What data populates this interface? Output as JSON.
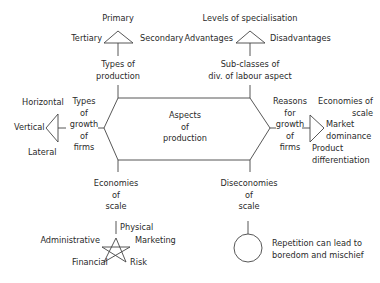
{
  "center": {
    "line1": "Aspects",
    "line2": "of",
    "line3": "production"
  },
  "types_of_production": {
    "label1": "Types of",
    "label2": "production",
    "items": {
      "top": "Primary",
      "left": "Tertiary",
      "right": "Secondary"
    }
  },
  "sub_classes": {
    "label1": "Sub-classes of",
    "label2": "div. of labour aspect",
    "items": {
      "top": "Levels of specialisation",
      "left": "Advantages",
      "right": "Disadvantages"
    }
  },
  "types_of_growth": {
    "l1": "Types",
    "l2": "of",
    "l3": "growth",
    "l4": "of",
    "l5": "firms",
    "items": {
      "top": "Horizontal",
      "mid": "Vertical",
      "bottom": "Lateral"
    }
  },
  "reasons_for_growth": {
    "l1": "Reasons",
    "l2": "for",
    "l3": "growth",
    "l4": "of",
    "l5": "firms",
    "items": {
      "a1": "Economies of",
      "a2": "scale",
      "b1": "Market",
      "b2": "dominance",
      "c1": "Product",
      "c2": "differentiation"
    }
  },
  "economies_of_scale": {
    "l1": "Economies",
    "l2": "of",
    "l3": "scale",
    "items": {
      "top": "Physical",
      "left": "Administrative",
      "right": "Marketing",
      "bl": "Financial",
      "br": "Risk"
    }
  },
  "diseconomies_of_scale": {
    "l1": "Diseconomies",
    "l2": "of",
    "l3": "scale",
    "items": {
      "l1": "Repetition can lead to",
      "l2": "boredom and mischief"
    }
  }
}
